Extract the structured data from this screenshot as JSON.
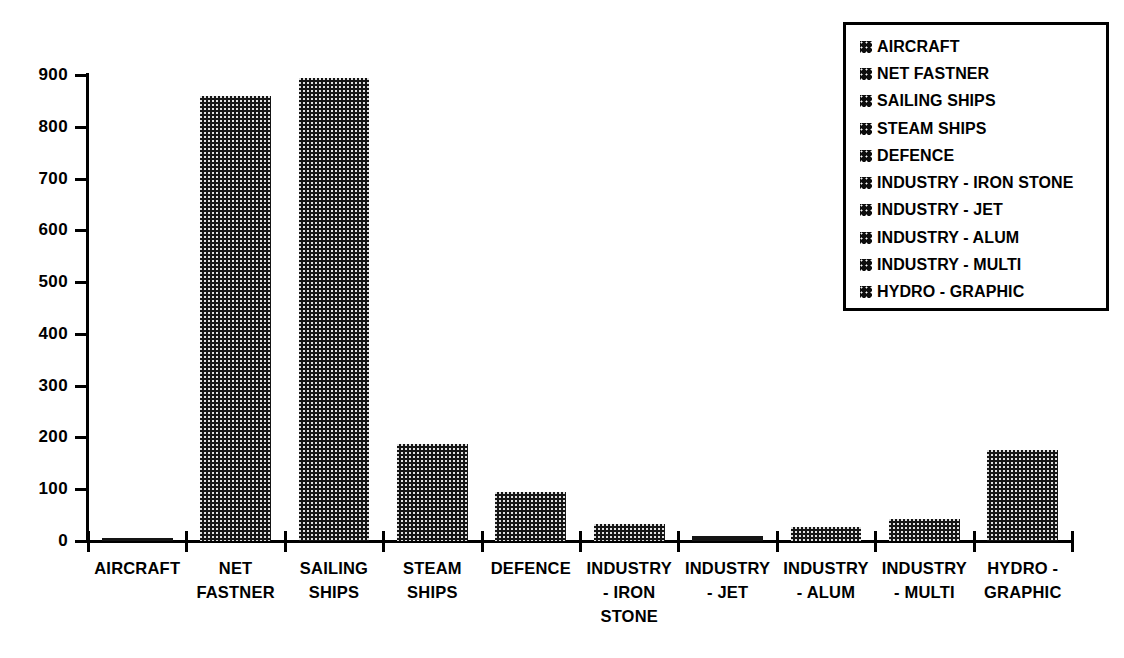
{
  "chart_data": {
    "type": "bar",
    "title": "",
    "xlabel": "",
    "ylabel": "",
    "ylim": [
      0,
      900
    ],
    "yticks": [
      0,
      100,
      200,
      300,
      400,
      500,
      600,
      700,
      800,
      900
    ],
    "grid": false,
    "legend_position": "top-right",
    "categories": [
      "AIRCRAFT",
      "NET\nFASTNER",
      "SAILING\nSHIPS",
      "STEAM\nSHIPS",
      "DEFENCE",
      "INDUSTRY\n- IRON\nSTONE",
      "INDUSTRY\n- JET",
      "INDUSTRY\n- ALUM",
      "INDUSTRY\n- MULTI",
      "HYDRO -\nGRAPHIC"
    ],
    "values": [
      6,
      860,
      895,
      188,
      95,
      32,
      10,
      28,
      42,
      175
    ],
    "legend_entries": [
      "AIRCRAFT",
      "NET FASTNER",
      "SAILING SHIPS",
      "STEAM SHIPS",
      "DEFENCE",
      "INDUSTRY - IRON STONE",
      "INDUSTRY - JET",
      "INDUSTRY - ALUM",
      "INDUSTRY - MULTI",
      "HYDRO - GRAPHIC"
    ],
    "series_color": "#151515",
    "background_color": "#ffffff"
  }
}
